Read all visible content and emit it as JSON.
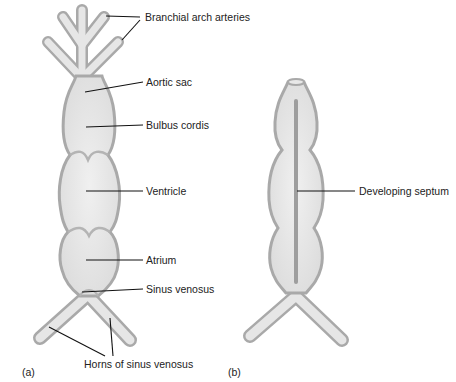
{
  "figure": {
    "panel_a": {
      "id": "(a)",
      "labels": {
        "branchial_arch_arteries": "Branchial arch arteries",
        "aortic_sac": "Aortic sac",
        "bulbus_cordis": "Bulbus cordis",
        "ventricle": "Ventricle",
        "atrium": "Atrium",
        "sinus_venosus": "Sinus venosus",
        "horns_of_sinus_venosus": "Horns of sinus venosus"
      }
    },
    "panel_b": {
      "id": "(b)",
      "labels": {
        "developing_septum": "Developing septum"
      }
    },
    "colors": {
      "tissue_fill": "#e4e4e4",
      "tissue_outline": "#a9a9a9",
      "septum": "#9e9e9e",
      "leader_line": "#111111",
      "text": "#222222"
    }
  }
}
